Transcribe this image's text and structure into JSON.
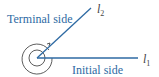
{
  "diagram": {
    "terminal_label": "Terminal side",
    "initial_label": "Initial side",
    "ray_terminal": "l",
    "ray_terminal_sub": "2",
    "ray_initial": "l",
    "ray_initial_sub": "1",
    "colors": {
      "ray": "#2e6aa3",
      "text": "#2e6aa3",
      "arc": "#333333"
    }
  }
}
